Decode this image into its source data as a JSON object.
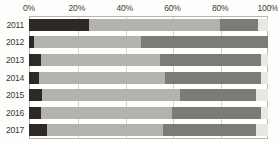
{
  "chart_data": {
    "type": "bar",
    "subtype": "stacked-bar-horizontal-100pct",
    "title": "",
    "subtitle": "",
    "xlabel": "",
    "ylabel": "",
    "orientation": "horizontal",
    "stacked": true,
    "normalized_percent": true,
    "grid": true,
    "grid_axis": "x",
    "legend": false,
    "legend_position": "none",
    "xlim": [
      0,
      100
    ],
    "xticks": [
      0,
      20,
      40,
      60,
      80,
      100
    ],
    "xtick_labels": [
      "0%",
      "20%",
      "40%",
      "60%",
      "80%",
      "100%"
    ],
    "x_axis_position": "top",
    "categories": [
      "2011",
      "2012",
      "2013",
      "2014",
      "2015",
      "2016",
      "2017"
    ],
    "series": [
      {
        "name": "segment-1",
        "color": "#2d2926",
        "values": [
          25.0,
          2.0,
          5.0,
          4.0,
          5.5,
          5.0,
          7.5
        ]
      },
      {
        "name": "segment-2",
        "color": "#b3b2ae",
        "values": [
          55.0,
          45.0,
          50.0,
          53.0,
          57.5,
          55.0,
          48.5
        ]
      },
      {
        "name": "segment-3",
        "color": "#7d7b77",
        "values": [
          16.0,
          53.0,
          42.0,
          40.0,
          32.0,
          37.0,
          39.0
        ]
      },
      {
        "name": "segment-4",
        "color": "#e8e7e3",
        "values": [
          4.0,
          0.0,
          3.0,
          3.0,
          5.0,
          3.0,
          5.0
        ]
      }
    ],
    "colors": {
      "segment_1": "#2d2926",
      "segment_2": "#b3b2ae",
      "segment_3": "#7d7b77",
      "segment_4": "#e8e7e3",
      "gridline": "#d8d5d1",
      "plot_border": "#b9b5b0",
      "tick_text": "#3b3733",
      "background": "#fdfdfc"
    }
  }
}
